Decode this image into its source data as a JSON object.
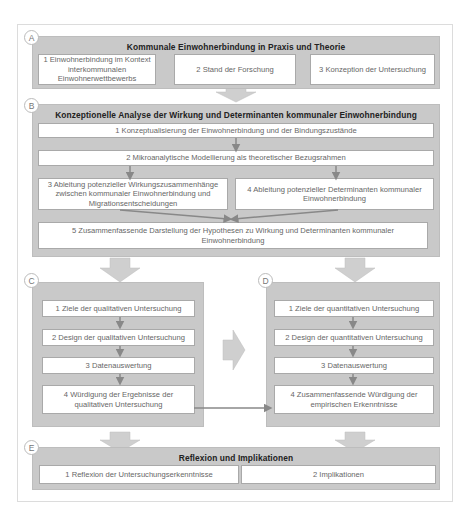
{
  "diagram": {
    "sections": {
      "A": {
        "label": "A",
        "title": "Kommunale Einwohnerbindung in Praxis und Theorie",
        "boxes": [
          "1 Einwohnerbindung im Kontext interkommunalen Einwohnerwettbewerbs",
          "2 Stand der Forschung",
          "3 Konzeption der Untersuchung"
        ]
      },
      "B": {
        "label": "B",
        "title": "Konzeptionelle Analyse der Wirkung und Determinanten kommunaler Einwohnerbindung",
        "boxes": [
          "1 Konzeptualisierung der Einwohnerbindung und der Bindungszustände",
          "2 Mikroanalytische Modellierung als theoretischer Bezugsrahmen",
          "3 Ableitung potenzieller Wirkungszusammenhänge zwischen kommunaler Einwohnerbindung und Migrationsentscheidungen",
          "4 Ableitung potenzieller Determinanten kommunaler Einwohnerbindung",
          "5 Zusammenfassende Darstellung der Hypothesen zu Wirkung und Determinanten kommunaler Einwohnerbindung"
        ]
      },
      "C": {
        "label": "C",
        "boxes": [
          "1 Ziele der qualitativen Untersuchung",
          "2 Design der qualitativen Untersuchung",
          "3 Datenauswertung",
          "4 Würdigung der Ergebnisse der qualitativen Untersuchung"
        ]
      },
      "D": {
        "label": "D",
        "boxes": [
          "1 Ziele der quantitativen Untersuchung",
          "2 Design der quantitativen Untersuchung",
          "3 Datenauswertung",
          "4 Zusammenfassende Würdigung der empirischen Erkenntnisse"
        ]
      },
      "E": {
        "label": "E",
        "title": "Reflexion und Implikationen",
        "boxes": [
          "1 Reflexion der Untersuchungserkenntnisse",
          "2 Implikationen"
        ]
      }
    },
    "colors": {
      "section_fill": "#c9c9c9",
      "box_fill": "#ffffff",
      "arrow_fill": "#cfcfcf",
      "connector": "#888888",
      "title_text": "#222222",
      "box_text": "#666666"
    }
  }
}
